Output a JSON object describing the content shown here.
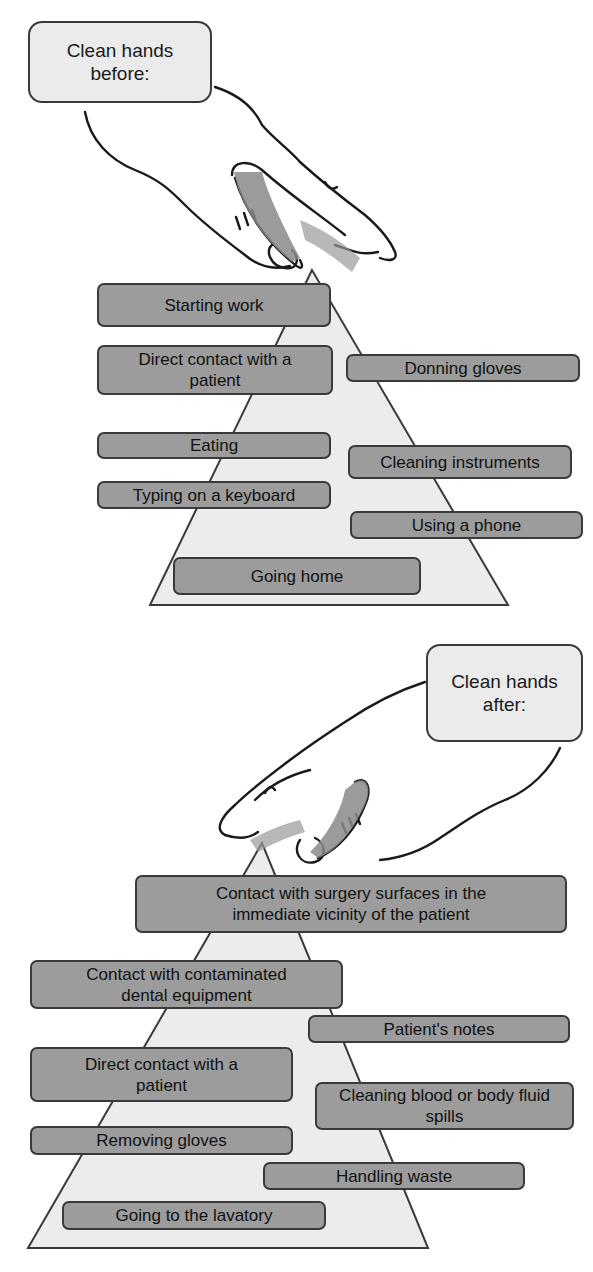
{
  "top_panel": {
    "callout": "Clean hands before:",
    "items": [
      "Starting work",
      "Direct contact with a patient",
      "Donning gloves",
      "Eating",
      "Cleaning instruments",
      "Typing on a keyboard",
      "Using a phone",
      "Going home"
    ]
  },
  "bottom_panel": {
    "callout": "Clean hands after:",
    "items": [
      "Contact with surgery surfaces in the immediate vicinity of the patient",
      "Contact with contaminated dental equipment",
      "Patient's notes",
      "Direct contact with a patient",
      "Cleaning blood or body fluid spills",
      "Removing gloves",
      "Handling waste",
      "Going to the lavatory"
    ]
  },
  "colors": {
    "label_fill": "#9c9c9c",
    "pyramid_fill": "#ebebeb",
    "callout_fill": "#ebebeb",
    "outline": "#3a3a3a"
  }
}
